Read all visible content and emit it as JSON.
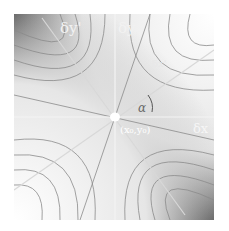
{
  "diagram": {
    "type": "saddle-point contour plot",
    "labels": {
      "dy_prime": "δy'",
      "dy": "δy",
      "dx": "δx",
      "dx_prime": "δx'",
      "alpha": "α",
      "point": "(x₀,y₀)"
    },
    "colors": {
      "dark": "#3a3a3a",
      "mid": "#b8b8b8",
      "light": "#f0f0f0",
      "axis": "#f4f4f4",
      "contour": "#8a8a8a"
    }
  }
}
